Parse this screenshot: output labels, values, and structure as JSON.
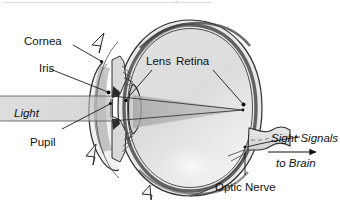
{
  "figure": {
    "type": "anatomical-diagram",
    "background_color": "#ffffff",
    "ink_color": "#111111"
  },
  "labels": {
    "cornea": "Cornea",
    "iris": "Iris",
    "light": "Light",
    "pupil": "Pupil",
    "lens": "Lens",
    "retina": "Retina",
    "optic_nerve": "Optic Nerve",
    "sight_signals": "Sight Signals",
    "to_brain": "to Brain"
  },
  "structures": [
    {
      "name": "cornea",
      "label": "Cornea",
      "italic": false
    },
    {
      "name": "iris",
      "label": "Iris",
      "italic": false
    },
    {
      "name": "pupil",
      "label": "Pupil",
      "italic": false
    },
    {
      "name": "lens",
      "label": "Lens",
      "italic": false
    },
    {
      "name": "retina",
      "label": "Retina",
      "italic": false
    },
    {
      "name": "optic-nerve",
      "label": "Optic Nerve",
      "italic": false
    }
  ],
  "flow_labels": [
    {
      "name": "light",
      "label": "Light",
      "italic": true
    },
    {
      "name": "sight-signals",
      "label": "Sight Signals",
      "italic": true
    },
    {
      "name": "to-brain",
      "label": "to Brain",
      "italic": true
    }
  ],
  "colors": {
    "sclera_fill": "#e4e4e4",
    "vitreous_fill": "#dcdcdc",
    "highlight_fill": "#f7f7f7",
    "beam_fill": "#b9b9b9",
    "cone_fill": "#a8a8a8",
    "iris_fill": "#555555",
    "outline": "#2b2b2b"
  }
}
